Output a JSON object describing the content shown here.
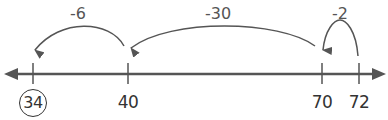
{
  "diagram": {
    "type": "number-line",
    "colors": {
      "line": "#555555",
      "text": "#333333"
    },
    "ticks": [
      {
        "value": "34",
        "x": 33,
        "circled": true
      },
      {
        "value": "40",
        "x": 128,
        "circled": false
      },
      {
        "value": "70",
        "x": 322,
        "circled": false
      },
      {
        "value": "72",
        "x": 359,
        "circled": false
      }
    ],
    "jumps": [
      {
        "label": "-2",
        "from": "72",
        "to": "70"
      },
      {
        "label": "-30",
        "from": "70",
        "to": "40"
      },
      {
        "label": "-6",
        "from": "40",
        "to": "34"
      }
    ]
  }
}
